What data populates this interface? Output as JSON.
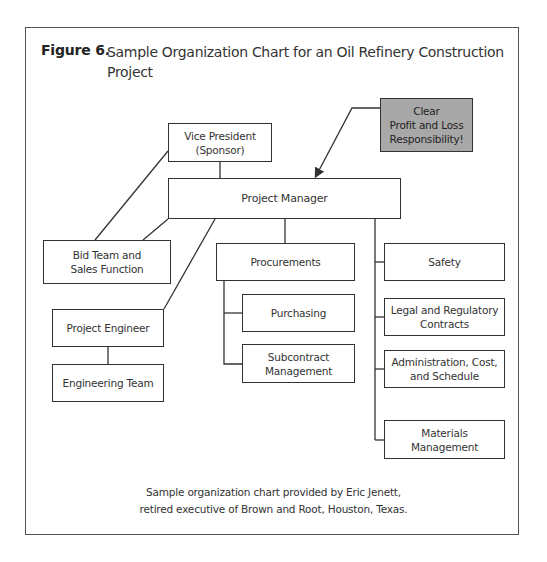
{
  "figure": {
    "label": "Figure 6.",
    "title": "Sample Organization Chart for an Oil Refinery Construction Project"
  },
  "chart": {
    "callout": "Clear\nProfit and Loss\nResponsibility!",
    "nodes": {
      "vice_president": "Vice President\n(Sponsor)",
      "project_manager": "Project Manager",
      "bid_team": "Bid Team and\nSales Function",
      "project_engineer": "Project Engineer",
      "engineering_team": "Engineering Team",
      "procurements": "Procurements",
      "purchasing": "Purchasing",
      "subcontract": "Subcontract\nManagement",
      "safety": "Safety",
      "legal": "Legal and Regulatory\nContracts",
      "administration": "Administration, Cost,\nand Schedule",
      "materials": "Materials\nManagement"
    },
    "colors": {
      "callout_fill": "#a8a8a8",
      "line": "#333333"
    }
  },
  "caption": {
    "line1": "Sample organization chart provided by Eric Jenett,",
    "line2": "retired executive of Brown and Root, Houston, Texas."
  }
}
